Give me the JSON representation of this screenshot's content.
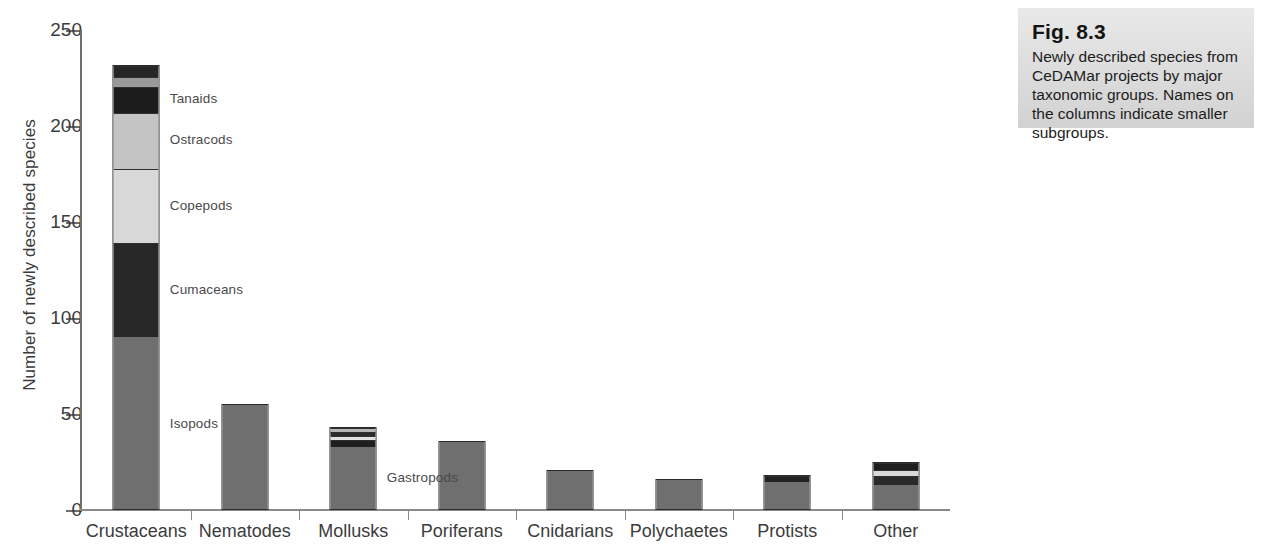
{
  "figure": {
    "caption_title": "Fig. 8.3",
    "caption_body": "Newly described species from CeDAMar projects by major taxonomic groups. Names on the columns indicate smaller subgroups."
  },
  "chart_data": {
    "type": "bar",
    "stacked": true,
    "title": "",
    "xlabel": "",
    "ylabel": "Number of newly described species",
    "ylim": [
      0,
      250
    ],
    "yticks": [
      0,
      50,
      100,
      150,
      200,
      250
    ],
    "ytick_labels": [
      "0",
      "50",
      "100",
      "150",
      "200",
      "250"
    ],
    "grid": false,
    "legend": "none (in-figure annotations)",
    "categories": [
      "Crustaceans",
      "Nematodes",
      "Mollusks",
      "Poriferans",
      "Cnidarians",
      "Polychaetes",
      "Protists",
      "Other"
    ],
    "totals": [
      232,
      55,
      43,
      36,
      21,
      16,
      18,
      25
    ],
    "stacks": [
      {
        "category": "Crustaceans",
        "total": 232,
        "segments": [
          {
            "name": "Isopods",
            "value": 90,
            "color": "#6f6f6f",
            "labeled": true
          },
          {
            "name": "Cumaceans",
            "value": 49,
            "color": "#272727",
            "labeled": true
          },
          {
            "name": "Copepods",
            "value": 39,
            "color": "#d8d8d8",
            "labeled": true
          },
          {
            "name": "Ostracods",
            "value": 29,
            "color": "#c4c4c4",
            "labeled": true
          },
          {
            "name": "Tanaids",
            "value": 14,
            "color": "#1c1c1c",
            "labeled": true
          },
          {
            "name": "subgroup-6",
            "value": 5,
            "color": "#9a9a9a",
            "labeled": false
          },
          {
            "name": "subgroup-7",
            "value": 6,
            "color": "#262626",
            "labeled": false
          }
        ]
      },
      {
        "category": "Nematodes",
        "total": 55,
        "segments": [
          {
            "name": "Nematodes",
            "value": 55,
            "color": "#6f6f6f",
            "labeled": false
          }
        ]
      },
      {
        "category": "Mollusks",
        "total": 43,
        "segments": [
          {
            "name": "Gastropods",
            "value": 33,
            "color": "#6f6f6f",
            "labeled": true
          },
          {
            "name": "subgroup-2",
            "value": 4,
            "color": "#1f1f1f",
            "labeled": false
          },
          {
            "name": "subgroup-3",
            "value": 2,
            "color": "#e2e2e2",
            "labeled": false
          },
          {
            "name": "subgroup-4",
            "value": 2,
            "color": "#2a2a2a",
            "labeled": false
          },
          {
            "name": "subgroup-5",
            "value": 2,
            "color": "#b5b5b5",
            "labeled": false
          }
        ]
      },
      {
        "category": "Poriferans",
        "total": 36,
        "segments": [
          {
            "name": "Poriferans",
            "value": 36,
            "color": "#6f6f6f",
            "labeled": false
          }
        ]
      },
      {
        "category": "Cnidarians",
        "total": 21,
        "segments": [
          {
            "name": "Cnidarians",
            "value": 21,
            "color": "#6f6f6f",
            "labeled": false
          }
        ]
      },
      {
        "category": "Polychaetes",
        "total": 16,
        "segments": [
          {
            "name": "Polychaetes",
            "value": 16,
            "color": "#6f6f6f",
            "labeled": false
          }
        ]
      },
      {
        "category": "Protists",
        "total": 18,
        "segments": [
          {
            "name": "subgroup-1",
            "value": 15,
            "color": "#6f6f6f",
            "labeled": false
          },
          {
            "name": "subgroup-2",
            "value": 3,
            "color": "#232323",
            "labeled": false
          }
        ]
      },
      {
        "category": "Other",
        "total": 25,
        "segments": [
          {
            "name": "subgroup-1",
            "value": 13,
            "color": "#6f6f6f",
            "labeled": false
          },
          {
            "name": "subgroup-2",
            "value": 5,
            "color": "#2a2a2a",
            "labeled": false
          },
          {
            "name": "subgroup-3",
            "value": 3,
            "color": "#d9d9d9",
            "labeled": false
          },
          {
            "name": "subgroup-4",
            "value": 4,
            "color": "#1e1e1e",
            "labeled": false
          }
        ]
      }
    ],
    "annotations": [
      {
        "text": "Tanaids",
        "stack": "Crustaceans",
        "segment": "Tanaids"
      },
      {
        "text": "Ostracods",
        "stack": "Crustaceans",
        "segment": "Ostracods"
      },
      {
        "text": "Copepods",
        "stack": "Crustaceans",
        "segment": "Copepods"
      },
      {
        "text": "Cumaceans",
        "stack": "Crustaceans",
        "segment": "Cumaceans"
      },
      {
        "text": "Isopods",
        "stack": "Crustaceans",
        "segment": "Isopods"
      },
      {
        "text": "Gastropods",
        "stack": "Mollusks",
        "segment": "Gastropods"
      }
    ],
    "colors": {
      "bar_gray": "#6f6f6f",
      "bar_dark": "#262626",
      "bar_light": "#d8d8d8",
      "axis": "#8a8a8a",
      "text": "#3c3c3c"
    }
  }
}
